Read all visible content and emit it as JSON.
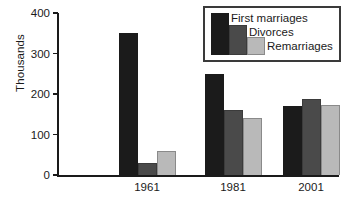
{
  "chart_data": {
    "type": "bar",
    "title": "",
    "subtitle": "",
    "xlabel": "",
    "ylabel": "Thousands",
    "categories": [
      "1961",
      "1981",
      "2001"
    ],
    "series": [
      {
        "name": "First marriages",
        "color": "#1b1b1b",
        "values": [
          350,
          250,
          170
        ]
      },
      {
        "name": "Divorces",
        "color": "#4a4a4a",
        "values": [
          30,
          160,
          188
        ]
      },
      {
        "name": "Remarriages",
        "color": "#b9b9b9",
        "values": [
          60,
          141,
          173
        ]
      }
    ],
    "ylim": [
      0,
      400
    ],
    "yticks": [
      0,
      100,
      200,
      300,
      400
    ],
    "ytick_labels": [
      "0",
      "100",
      "200",
      "300",
      "400"
    ],
    "grid": false,
    "legend_position": "top-right",
    "legend_boxed": true,
    "axis_color": "#1a1a1a"
  }
}
